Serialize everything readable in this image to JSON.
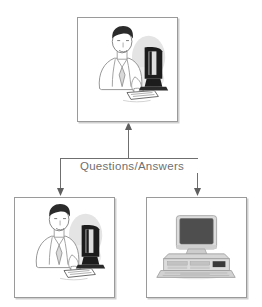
{
  "diagram": {
    "type": "flow-diagram",
    "background_color": "#ffffff",
    "line_color": "#6f6f6f",
    "box_border_color": "#9a9a9a",
    "box_shadow_color": "#cfcfcf",
    "label_text_color": "#6f6f6f"
  },
  "nodes": [
    {
      "id": "interrogator",
      "name": "interrogator",
      "position": "top-center",
      "icon": "person-at-terminal-icon",
      "description": "Man in suit seated at a computer terminal with keyboard",
      "x": 77,
      "y": 17,
      "width": 101,
      "height": 105
    },
    {
      "id": "human",
      "name": "human-respondent",
      "position": "bottom-left",
      "icon": "person-at-terminal-icon",
      "description": "Man in suit seated at a computer terminal with keyboard",
      "x": 14,
      "y": 197,
      "width": 101,
      "height": 101
    },
    {
      "id": "computer",
      "name": "computer-respondent",
      "position": "bottom-right",
      "icon": "desktop-computer-icon",
      "description": "Desktop computer with monitor, horizontal case and keyboard",
      "x": 146,
      "y": 197,
      "width": 101,
      "height": 101
    }
  ],
  "edges": {
    "label": "Questions/Answers",
    "bus_y": 158,
    "bus_x_start": 60,
    "bus_x_end": 197,
    "up_arrow_to": "interrogator",
    "down_arrow_to": [
      "human",
      "computer"
    ]
  }
}
